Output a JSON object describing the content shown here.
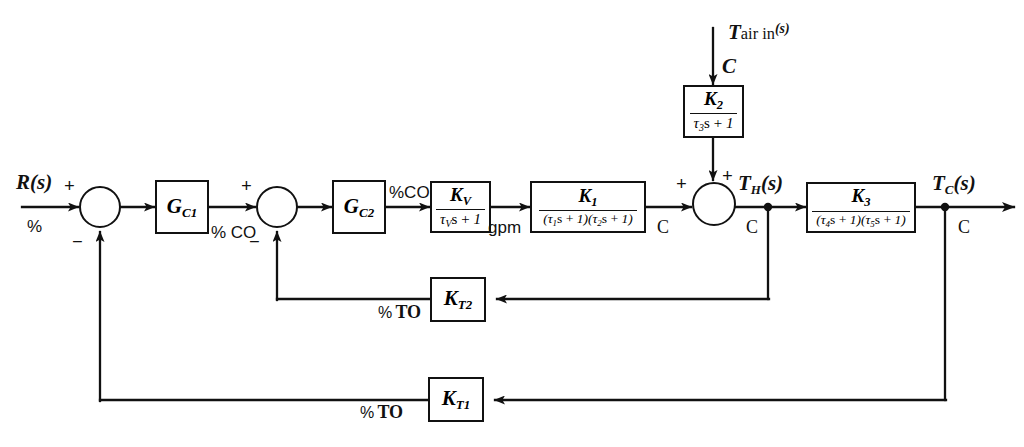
{
  "diagram": {
    "type": "block-diagram",
    "line_color": "#111111",
    "background": "#ffffff"
  },
  "signals": {
    "setpoint": "R(s)",
    "setpoint_unit": "%",
    "controller1_out_unit": "% CO",
    "controller2_out_unit": "%CO",
    "valve_out_unit": "gpm",
    "process_out_unit": "C",
    "disturbance": "Tair in(s)",
    "disturbance_T": "T",
    "disturbance_sub": "air in",
    "disturbance_sup": "(s)",
    "disturbance_unit": "C",
    "inner_output": "TH(s)",
    "inner_output_T": "T",
    "inner_output_sub": "H",
    "inner_output_paren": "(s)",
    "inner_output_unit": "C",
    "outer_output": "TC(s)",
    "outer_output_T": "T",
    "outer_output_sub": "C",
    "outer_output_paren": "(s)",
    "outer_output_unit": "C",
    "inner_feedback_unit": "% TO",
    "outer_feedback_unit": "% TO",
    "sum_unit_after_summer3": "C",
    "sum_unit_before_summer3": "C"
  },
  "blocks": {
    "controller1": {
      "name": "GC1",
      "symbol": "G",
      "subscript": "C1",
      "kind": "controller",
      "description": "Primary (master) controller"
    },
    "controller2": {
      "name": "GC2",
      "symbol": "G",
      "subscript": "C2",
      "kind": "controller",
      "description": "Secondary (slave) controller"
    },
    "valve": {
      "name": "KV/(tauV s + 1)",
      "numerator": "KV",
      "num_symbol": "K",
      "num_sub": "V",
      "denominator": "tauV s + 1",
      "den_tau_sub": "V",
      "kind": "first-order-lag",
      "description": "Control valve"
    },
    "process_inner": {
      "name": "K1/((tau1 s + 1)(tau2 s + 1))",
      "num_symbol": "K",
      "num_sub": "1",
      "den_tau1_sub": "1",
      "den_tau2_sub": "2",
      "kind": "second-order-lag",
      "description": "Inner process"
    },
    "disturbance_tf": {
      "name": "K2/(tau3 s + 1)",
      "num_symbol": "K",
      "num_sub": "2",
      "den_tau_sub": "3",
      "kind": "first-order-lag",
      "description": "Disturbance transfer function"
    },
    "process_outer": {
      "name": "K3/((tau4 s + 1)(tau5 s + 1))",
      "num_symbol": "K",
      "num_sub": "3",
      "den_tau1_sub": "4",
      "den_tau2_sub": "5",
      "kind": "second-order-lag",
      "description": "Outer process"
    },
    "transmitter_inner": {
      "name": "KT2",
      "symbol": "K",
      "subscript": "T2",
      "kind": "transmitter",
      "description": "Inner loop temperature transmitter"
    },
    "transmitter_outer": {
      "name": "KT1",
      "symbol": "K",
      "subscript": "T1",
      "kind": "transmitter",
      "description": "Outer loop temperature transmitter"
    }
  },
  "summers": {
    "summer1": {
      "name": "summing-junction-1",
      "plus": "+",
      "minus": "−"
    },
    "summer2": {
      "name": "summing-junction-2",
      "plus": "+",
      "minus": "−"
    },
    "summer3": {
      "name": "summing-junction-3",
      "plus_left": "+",
      "plus_top": "+"
    }
  }
}
